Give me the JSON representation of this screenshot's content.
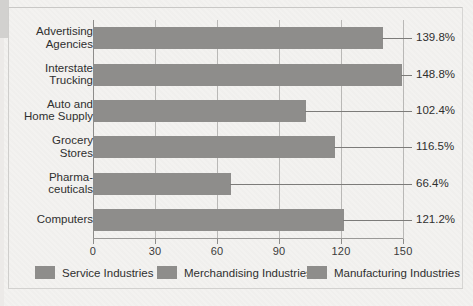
{
  "chart_data": {
    "type": "bar",
    "orientation": "horizontal",
    "title": "",
    "xlabel": "",
    "ylabel": "",
    "xlim": [
      0,
      150
    ],
    "xticks": [
      "0",
      "30",
      "60",
      "90",
      "120",
      "150"
    ],
    "grid": "vertical",
    "legend_position": "bottom",
    "categories": [
      "Advertising\nAgencies",
      "Interstate\nTrucking",
      "Auto and\nHome Supply",
      "Grocery\nStores",
      "Pharma-\nceuticals",
      "Computers"
    ],
    "values": [
      139.8,
      148.8,
      102.4,
      116.5,
      66.4,
      121.2
    ],
    "value_labels": [
      "139.8%",
      "148.8%",
      "102.4%",
      "116.5%",
      "66.4%",
      "121.2%"
    ],
    "series": [
      {
        "name": "Percent",
        "values": [
          139.8,
          148.8,
          102.4,
          116.5,
          66.4,
          121.2
        ]
      }
    ],
    "legend": [
      {
        "label": "Service Industries",
        "color": "#8e8d8b"
      },
      {
        "label": "Merchandising Industries",
        "color": "#8e8d8b"
      },
      {
        "label": "Manufacturing Industries",
        "color": "#8e8d8b"
      }
    ],
    "colors": {
      "bar": "#8e8d8b",
      "grid": "#b9b8b6",
      "axis": "#8d8c8a",
      "text": "#2f2f2f",
      "background": "#f3f2f0"
    }
  }
}
